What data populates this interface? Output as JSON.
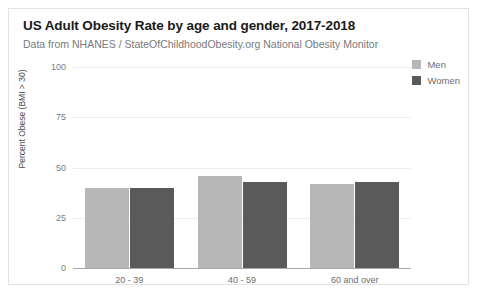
{
  "chart_data": {
    "type": "bar",
    "title": "US Adult Obesity Rate by age and gender, 2017-2018",
    "subtitle": "Data from NHANES / StateOfChildhoodObesity.org National Obesity Monitor",
    "xlabel": "",
    "ylabel": "Percent Obese (BMI > 30)",
    "ylim": [
      0,
      100
    ],
    "yticks": [
      0,
      25,
      50,
      75,
      100
    ],
    "ytick_labels": [
      "0",
      "25",
      "50",
      "75",
      "100"
    ],
    "grid": true,
    "legend_position": "top-right",
    "categories": [
      "20 - 39",
      "40 - 59",
      "60 and over"
    ],
    "series": [
      {
        "name": "Men",
        "color": "#b7b7b7",
        "values": [
          40,
          46,
          42
        ]
      },
      {
        "name": "Women",
        "color": "#5a5a5a",
        "values": [
          40,
          43,
          43
        ]
      }
    ]
  }
}
